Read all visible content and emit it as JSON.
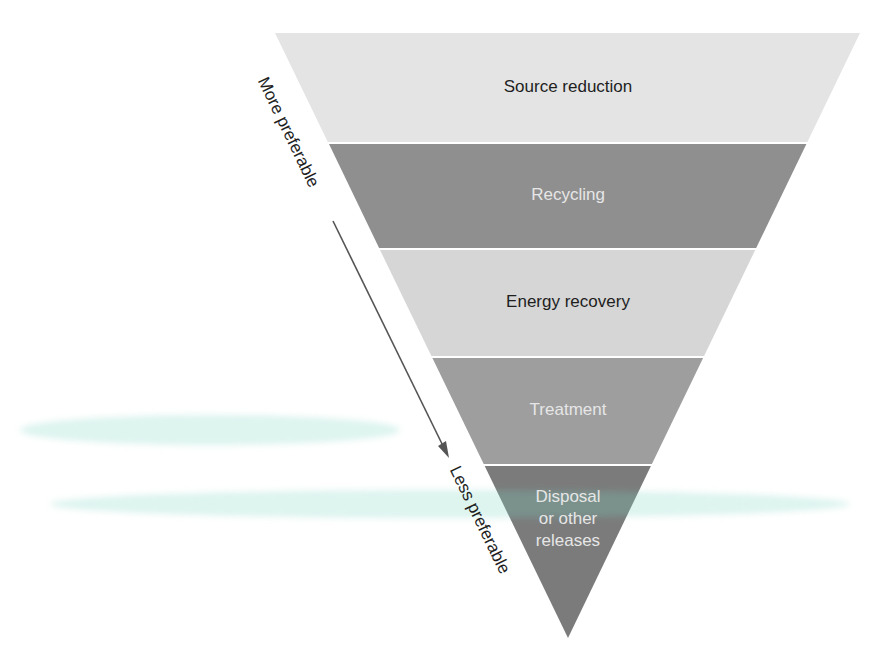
{
  "diagram": {
    "type": "inverted-pyramid",
    "colors": {
      "band_light": "#e2e2e2",
      "band_dark": "#8c8c8c",
      "band_mid": "#d4d4d4",
      "band_treatment": "#9c9c9c",
      "band_disposal": "#7a7a7a",
      "arrow": "#555555"
    },
    "levels": [
      {
        "label": "Source reduction"
      },
      {
        "label": "Recycling"
      },
      {
        "label": "Energy recovery"
      },
      {
        "label": "Treatment"
      },
      {
        "label_lines": [
          "Disposal",
          "or other",
          "releases"
        ]
      }
    ],
    "axis": {
      "top_label": "More preferable",
      "bottom_label": "Less preferable"
    }
  }
}
